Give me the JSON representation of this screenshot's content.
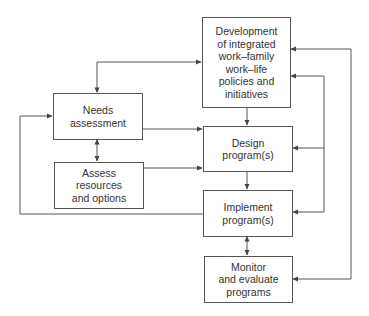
{
  "diagram": {
    "type": "flowchart",
    "colors": {
      "line": "#555555",
      "text": "#333333",
      "background": "#ffffff"
    },
    "nodes": {
      "development": {
        "label": "Development\nof integrated\nwork–family\nwork–life\npolicies and\ninitiatives"
      },
      "needs": {
        "label": "Needs\nassessment"
      },
      "assess": {
        "label": "Assess\nresources\nand options"
      },
      "design": {
        "label": "Design\nprogram(s)"
      },
      "implement": {
        "label": "Implement\nprogram(s)"
      },
      "monitor": {
        "label": "Monitor\nand evaluate\nprograms"
      }
    },
    "edges": [
      {
        "from": "needs",
        "to": "development",
        "bidirectional": true
      },
      {
        "from": "needs",
        "to": "design"
      },
      {
        "from": "assess",
        "to": "design"
      },
      {
        "from": "needs",
        "to": "assess",
        "bidirectional": true
      },
      {
        "from": "development",
        "to": "design"
      },
      {
        "from": "design",
        "to": "implement"
      },
      {
        "from": "implement",
        "to": "monitor",
        "bidirectional": true
      },
      {
        "from": "implement",
        "to": "needs"
      },
      {
        "from": "feedback-inner",
        "to": "development"
      },
      {
        "from": "feedback-inner",
        "to": "design"
      },
      {
        "from": "feedback-inner",
        "to": "implement"
      },
      {
        "from": "feedback-outer",
        "to": "development"
      },
      {
        "from": "feedback-outer",
        "to": "monitor"
      }
    ]
  }
}
